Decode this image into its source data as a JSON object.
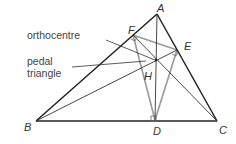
{
  "diagram": {
    "annotations": {
      "orthocentre": "orthocentre",
      "pedal_line1": "pedal",
      "pedal_line2": "triangle"
    },
    "vertices": {
      "A": "A",
      "B": "B",
      "C": "C",
      "D": "D",
      "E": "E",
      "F": "F",
      "H": "H"
    },
    "colors": {
      "main_lines": "#222222",
      "pedal_lines": "#999999",
      "text": "#444444"
    }
  }
}
